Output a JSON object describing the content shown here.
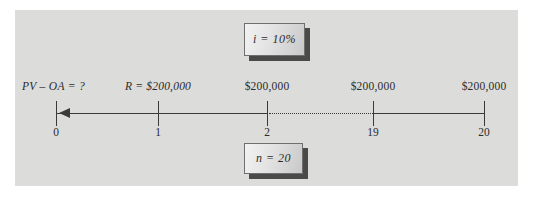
{
  "figure": {
    "type": "time-value-of-money-timeline",
    "background_color": "#ffffff",
    "panel_color": "#dcdcdb",
    "line_color": "#3a3a3a"
  },
  "parameters": {
    "interest": "i = 10%",
    "periods": "n = 20"
  },
  "present_value": {
    "label": "PV – OA = ?"
  },
  "axis": {
    "direction": "left",
    "arrow": "left-arrowhead-icon",
    "dotted_gap_between": [
      "2",
      "19"
    ],
    "periods": [
      {
        "period": "0",
        "x": 56,
        "cash_label": "",
        "cash_italic": false
      },
      {
        "period": "1",
        "x": 158,
        "cash_label": "R = $200,000",
        "cash_italic": true
      },
      {
        "period": "2",
        "x": 267,
        "cash_label": "$200,000",
        "cash_italic": false
      },
      {
        "period": "19",
        "x": 373,
        "cash_label": "$200,000",
        "cash_italic": false
      },
      {
        "period": "20",
        "x": 484,
        "cash_label": "$200,000",
        "cash_italic": false
      }
    ]
  }
}
